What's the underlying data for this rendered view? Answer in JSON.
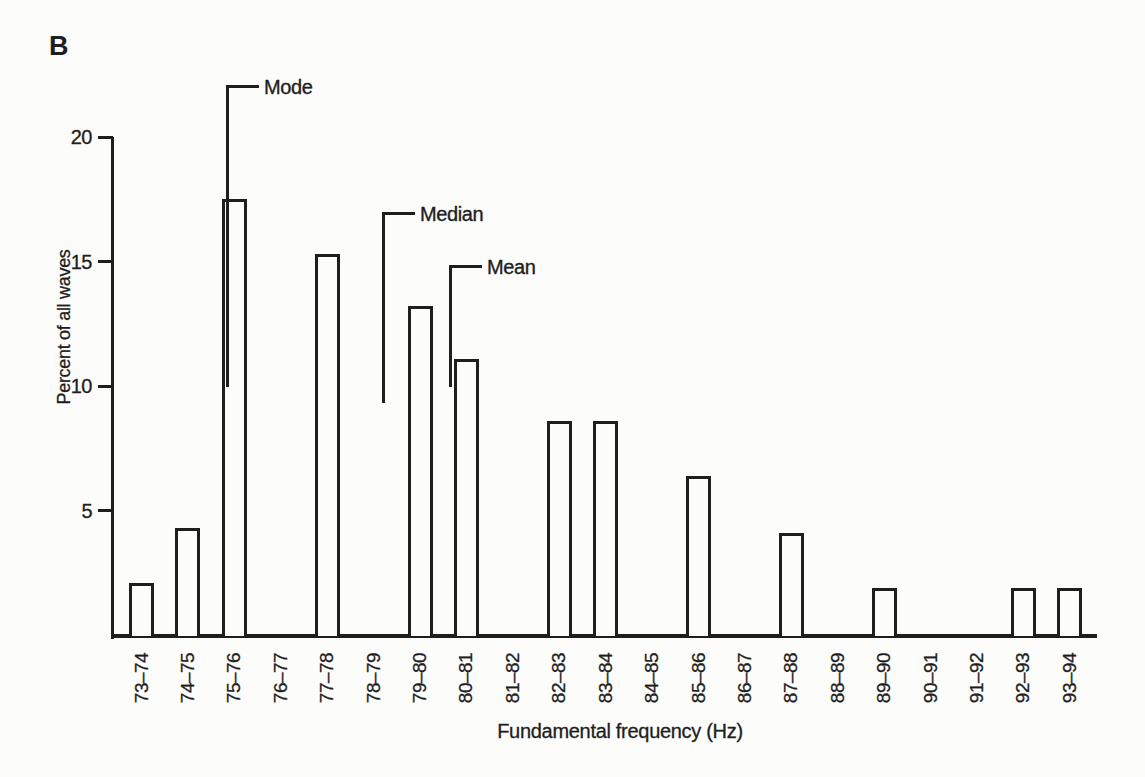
{
  "figure_label": "B",
  "colors": {
    "ink": "#1e1e1e",
    "paper": "#fcfcfb",
    "bar_fill": "#fcfcfb"
  },
  "chart_data": {
    "type": "bar",
    "title": "",
    "xlabel": "Fundamental frequency (Hz)",
    "ylabel": "Percent of all waves",
    "ylim": [
      0,
      20
    ],
    "yticks": [
      5,
      10,
      15,
      20
    ],
    "grid": false,
    "legend": false,
    "bar_style": "outlined, unfilled, separated histogram bars",
    "categories": [
      "73–74",
      "74–75",
      "75–76",
      "76–77",
      "77–78",
      "78–79",
      "79–80",
      "80–81",
      "81–82",
      "82–83",
      "83–84",
      "84–85",
      "85–86",
      "86–87",
      "87–88",
      "88–89",
      "89–90",
      "90–91",
      "91–92",
      "92–93",
      "93–94"
    ],
    "values": [
      2.1,
      4.3,
      17.5,
      0,
      15.3,
      0,
      13.2,
      11.1,
      0,
      8.6,
      8.6,
      0,
      6.4,
      0,
      4.1,
      0,
      1.9,
      0,
      0,
      1.9,
      1.9
    ],
    "annotations": [
      {
        "label": "Mode",
        "marks_hz_approx": 75.3,
        "at_category": "75–76"
      },
      {
        "label": "Median",
        "marks_hz_approx": 78.7,
        "at_category": "78–79"
      },
      {
        "label": "Mean",
        "marks_hz_approx": 80.2,
        "at_category": "80–81"
      }
    ]
  }
}
